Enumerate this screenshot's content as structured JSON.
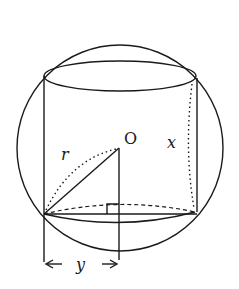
{
  "diagram": {
    "labels": {
      "center": "O",
      "radius": "r",
      "height": "x",
      "half_base": "y"
    }
  }
}
